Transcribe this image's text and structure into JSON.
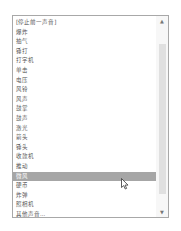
{
  "sound_list": {
    "items": [
      {
        "label": "[停止前一声音]"
      },
      {
        "label": "爆炸"
      },
      {
        "label": "抽气"
      },
      {
        "label": "锤打"
      },
      {
        "label": "打字机"
      },
      {
        "label": "单击"
      },
      {
        "label": "电压"
      },
      {
        "label": "风铃"
      },
      {
        "label": "风声"
      },
      {
        "label": "鼓掌"
      },
      {
        "label": "鼓声"
      },
      {
        "label": "激光"
      },
      {
        "label": "箭头"
      },
      {
        "label": "锤头"
      },
      {
        "label": "收款机"
      },
      {
        "label": "推动"
      },
      {
        "label": "微风"
      },
      {
        "label": "硬币"
      },
      {
        "label": "炸弹"
      },
      {
        "label": "照相机"
      },
      {
        "label": "其他声音..."
      }
    ],
    "selected_index": 16,
    "scroll_up_icon": "▲",
    "scroll_down_icon": "▼"
  }
}
